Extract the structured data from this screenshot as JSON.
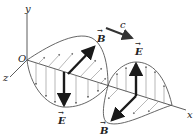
{
  "labels": {
    "y_axis": "y",
    "x_axis": "x",
    "z_axis": "z",
    "origin": "O",
    "speed": "c",
    "E_field_top": "E",
    "E_field_bottom": "E",
    "B_field_top": "B",
    "B_field_bottom": "B",
    "vector_mark": "→"
  },
  "colors": {
    "axis": "#333333",
    "curve": "#555555",
    "field_lines": "#777777",
    "vector": "#1a1a1a",
    "speed_arrow": "#333333"
  }
}
